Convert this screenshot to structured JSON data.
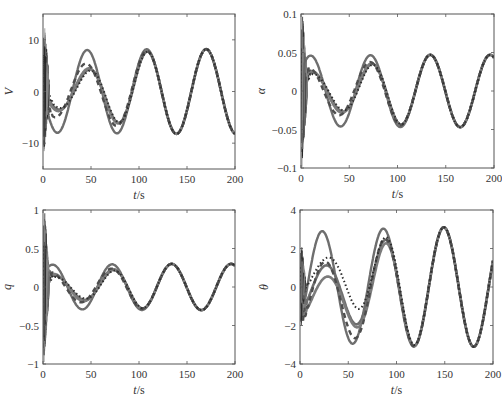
{
  "figure": {
    "width": 502,
    "height": 404,
    "line_color": "#6e6e6e",
    "frame_color": "#555555"
  },
  "chart_data": [
    {
      "type": "line",
      "id": "V",
      "ylabel": "V",
      "xlabel": "t/s",
      "xlim": [
        0,
        200
      ],
      "ylim": [
        -15,
        15
      ],
      "xticks": [
        0,
        50,
        100,
        150,
        200
      ],
      "yticks": [
        -10,
        0,
        10
      ],
      "ytick_labels": [
        "−10",
        "0",
        "10"
      ],
      "grid": false,
      "frame_px": {
        "left": 43,
        "top": 14,
        "right": 235,
        "bottom": 169
      },
      "steady_state": {
        "amplitude": 8.2,
        "period": 62,
        "peak_t": 170
      },
      "series": [
        {
          "name": "solid-large",
          "style": "solid",
          "initial_amplitude": 8.0,
          "initial_phase_offset": 0,
          "transient_until": 5
        },
        {
          "name": "solid-mid-1",
          "style": "solid",
          "initial_amplitude": 3.5,
          "initial_phase_offset": 2,
          "transient_until": 8
        },
        {
          "name": "solid-mid-2",
          "style": "solid",
          "initial_amplitude": 3.8,
          "initial_phase_offset": 1,
          "transient_until": 8
        },
        {
          "name": "dashed",
          "style": "dashed",
          "initial_amplitude": 5.0,
          "initial_phase_offset": -2,
          "transient_until": 10
        },
        {
          "name": "dotted",
          "style": "dotted",
          "initial_amplitude": 3.2,
          "initial_phase_offset": 3,
          "transient_until": 12
        }
      ],
      "transient": {
        "t_end": 6,
        "min": -12.5,
        "max": 13
      }
    },
    {
      "type": "line",
      "id": "alpha",
      "ylabel": "α",
      "xlabel": "t/s",
      "xlim": [
        0,
        200
      ],
      "ylim": [
        -0.1,
        0.1
      ],
      "xticks": [
        0,
        50,
        100,
        150,
        200
      ],
      "yticks": [
        -0.1,
        -0.05,
        0,
        0.05,
        0.1
      ],
      "ytick_labels": [
        "−0.1",
        "−0.05",
        "0",
        "0.05",
        "0.1"
      ],
      "grid": false,
      "frame_px": {
        "left": 301,
        "top": 14,
        "right": 494,
        "bottom": 168
      },
      "steady_state": {
        "amplitude": 0.047,
        "period": 62,
        "peak_t": 134
      },
      "series": [
        {
          "name": "solid-large",
          "style": "solid",
          "initial_amplitude": 0.046,
          "initial_phase_offset": 0,
          "transient_until": 5
        },
        {
          "name": "solid-mid-1",
          "style": "solid",
          "initial_amplitude": 0.024,
          "initial_phase_offset": 2,
          "transient_until": 8
        },
        {
          "name": "solid-mid-2",
          "style": "solid",
          "initial_amplitude": 0.026,
          "initial_phase_offset": 1,
          "transient_until": 8
        },
        {
          "name": "dashed",
          "style": "dashed",
          "initial_amplitude": 0.03,
          "initial_phase_offset": -2,
          "transient_until": 10
        },
        {
          "name": "dotted",
          "style": "dotted",
          "initial_amplitude": 0.022,
          "initial_phase_offset": 3,
          "transient_until": 12
        }
      ],
      "transient": {
        "t_end": 6,
        "min": -0.1,
        "max": 0.1
      }
    },
    {
      "type": "line",
      "id": "q",
      "ylabel": "q",
      "xlabel": "t/s",
      "xlim": [
        0,
        200
      ],
      "ylim": [
        -1,
        1
      ],
      "xticks": [
        0,
        50,
        100,
        150,
        200
      ],
      "yticks": [
        -1,
        -0.5,
        0,
        0.5,
        1
      ],
      "ytick_labels": [
        "−1",
        "−0.5",
        "0",
        "0.5",
        "1"
      ],
      "grid": false,
      "frame_px": {
        "left": 43,
        "top": 210,
        "right": 235,
        "bottom": 364
      },
      "steady_state": {
        "amplitude": 0.3,
        "period": 62,
        "peak_t": 134
      },
      "series": [
        {
          "name": "solid-large",
          "style": "solid",
          "initial_amplitude": 0.29,
          "initial_phase_offset": 0,
          "transient_until": 5
        },
        {
          "name": "solid-mid-1",
          "style": "solid",
          "initial_amplitude": 0.15,
          "initial_phase_offset": 2,
          "transient_until": 8
        },
        {
          "name": "solid-mid-2",
          "style": "solid",
          "initial_amplitude": 0.17,
          "initial_phase_offset": 1,
          "transient_until": 8
        },
        {
          "name": "dashed",
          "style": "dashed",
          "initial_amplitude": 0.19,
          "initial_phase_offset": -2,
          "transient_until": 10
        },
        {
          "name": "dotted",
          "style": "dotted",
          "initial_amplitude": 0.13,
          "initial_phase_offset": 3,
          "transient_until": 12
        }
      ],
      "transient": {
        "t_end": 6,
        "min": -1,
        "max": 1
      }
    },
    {
      "type": "line",
      "id": "theta",
      "ylabel": "θ",
      "xlabel": "t/s",
      "xlim": [
        0,
        200
      ],
      "ylim": [
        -4,
        4
      ],
      "xticks": [
        0,
        50,
        100,
        150,
        200
      ],
      "yticks": [
        -4,
        -2,
        0,
        2,
        4
      ],
      "ytick_labels": [
        "−4",
        "−2",
        "0",
        "2",
        "4"
      ],
      "grid": false,
      "frame_px": {
        "left": 300,
        "top": 210,
        "right": 493,
        "bottom": 364
      },
      "steady_state": {
        "amplitude": 3.1,
        "period": 62,
        "peak_t": 149
      },
      "series": [
        {
          "name": "solid-large",
          "style": "solid",
          "initial_amplitude": 2.9,
          "initial_offset": 0,
          "initial_phase_offset": -2,
          "transient_until": 5
        },
        {
          "name": "solid-mid-1",
          "style": "solid",
          "initial_amplitude": 1.3,
          "initial_offset": -0.2,
          "initial_phase_offset": 2,
          "transient_until": 8
        },
        {
          "name": "solid-mid-2",
          "style": "solid",
          "initial_amplitude": 1.1,
          "initial_offset": -0.6,
          "initial_phase_offset": 3,
          "transient_until": 8
        },
        {
          "name": "dashed",
          "style": "dashed",
          "initial_amplitude": 1.9,
          "initial_offset": -0.6,
          "initial_phase_offset": 1,
          "transient_until": 10
        },
        {
          "name": "dotted",
          "style": "dotted",
          "initial_amplitude": 0.9,
          "initial_offset": 0.6,
          "initial_phase_offset": 4,
          "transient_until": 12
        }
      ],
      "transient": {
        "t_end": 5,
        "min": -2.2,
        "max": 2.2
      }
    }
  ]
}
